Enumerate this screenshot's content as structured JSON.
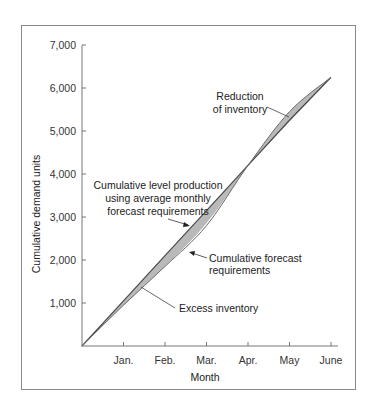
{
  "chart_data": {
    "type": "area",
    "title": "",
    "xlabel": "Month",
    "ylabel": "Cumulative demand units",
    "categories": [
      "",
      "Jan.",
      "Feb.",
      "Mar.",
      "Apr.",
      "May",
      "June"
    ],
    "x_ticks": [
      "Jan.",
      "Feb.",
      "Mar.",
      "Apr.",
      "May",
      "June"
    ],
    "y_ticks": [
      "1,000",
      "2,000",
      "3,000",
      "4,000",
      "5,000",
      "6,000",
      "7,000"
    ],
    "y_tick_values": [
      1000,
      2000,
      3000,
      4000,
      5000,
      6000,
      7000
    ],
    "ylim": [
      0,
      7000
    ],
    "grid": false,
    "legend": "none (inline annotations)",
    "series": [
      {
        "name": "Cumulative level production using average monthly forecast requirements",
        "values": [
          0,
          1050,
          2100,
          3150,
          4200,
          5250,
          6250
        ]
      },
      {
        "name": "Cumulative forecast requirements",
        "values": [
          0,
          950,
          1850,
          2800,
          4200,
          5450,
          6250
        ]
      }
    ],
    "annotations": [
      {
        "text": "Cumulative level production using average monthly forecast requirements",
        "points_to": "level production line (near Mar.)"
      },
      {
        "text": "Cumulative forecast requirements",
        "points_to": "forecast curve (near Mar.)"
      },
      {
        "text": "Excess inventory",
        "points_to": "shaded area between lines, Jan.–Apr."
      },
      {
        "text": "Reduction of inventory",
        "points_to": "shaded area between lines, Apr.–June"
      }
    ],
    "colors": {
      "fill": "#b9b9b9",
      "line": "#555555",
      "axis": "#777777"
    }
  },
  "labels": {
    "level_line": [
      "Cumulative level production",
      "using average monthly",
      "forecast requirements"
    ],
    "forecast": [
      "Cumulative forecast",
      "requirements"
    ],
    "excess": "Excess inventory",
    "reduction": [
      "Reduction",
      "of inventory"
    ],
    "xlabel": "Month",
    "ylabel": "Cumulative demand units",
    "x_ticks": [
      "Jan.",
      "Feb.",
      "Mar.",
      "Apr.",
      "May",
      "June"
    ],
    "y_ticks": [
      "1,000",
      "2,000",
      "3,000",
      "4,000",
      "5,000",
      "6,000",
      "7,000"
    ]
  }
}
